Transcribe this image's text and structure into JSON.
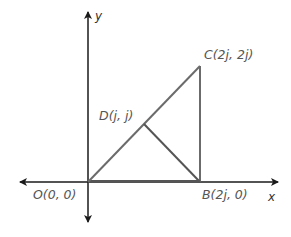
{
  "diagram": {
    "type": "coordinate-geometry",
    "axes": {
      "x_label": "x",
      "y_label": "y"
    },
    "points": {
      "O": {
        "label": "O(0, 0)",
        "coords": [
          "0",
          "0"
        ]
      },
      "B": {
        "label": "B(2j, 0)",
        "coords": [
          "2j",
          "0"
        ]
      },
      "C": {
        "label": "C(2j, 2j)",
        "coords": [
          "2j",
          "2j"
        ]
      },
      "D": {
        "label": "D(j, j)",
        "coords": [
          "j",
          "j"
        ]
      }
    },
    "segments": [
      "OB",
      "BC",
      "OC",
      "DB"
    ],
    "colors": {
      "axes": "#1a1a1a",
      "shape": "#6b6b6b",
      "labels": "#555555"
    }
  }
}
